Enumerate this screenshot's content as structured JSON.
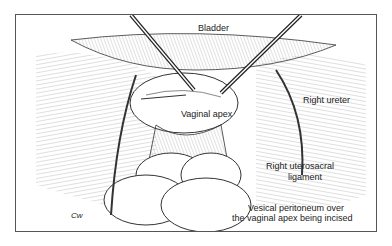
{
  "figure": {
    "type": "surgical line illustration",
    "labels": {
      "bladder": "Bladder",
      "vaginal_apex": "Vaginal apex",
      "right_ureter": "Right ureter",
      "right_uterosacral_1": "Right uterosacral",
      "right_uterosacral_2": "ligament",
      "vesical_1": "Vesical peritoneum over",
      "vesical_2": "the vaginal apex being incised",
      "signature": "Cw"
    }
  }
}
